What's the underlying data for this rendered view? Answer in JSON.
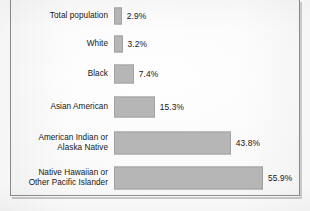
{
  "chart_data": {
    "type": "bar",
    "orientation": "horizontal",
    "title": "",
    "subtitle": "",
    "xlabel": "",
    "ylabel": "",
    "grid": false,
    "legend": null,
    "axis_visible": false,
    "value_suffix": "%",
    "xlim": [
      0,
      55.9
    ],
    "categories": [
      "Total population",
      "White",
      "Black",
      "Asian American",
      "American Indian or\nAlaska Native",
      "Native Hawaiian or\nOther Pacific Islander"
    ],
    "values": [
      2.9,
      3.2,
      7.4,
      15.3,
      43.8,
      55.9
    ],
    "value_labels": [
      "2.9%",
      "3.2%",
      "7.4%",
      "15.3%",
      "43.8%",
      "55.9%"
    ],
    "bar_color": "#b6b6b6",
    "bar_border_color": "#a2a2a2",
    "text_color": "#161616",
    "frame_border_color": "#8d8d8d",
    "background_color": "#fcfcfc"
  },
  "layout": {
    "bar_origin_x": 113,
    "px_per_percent": 2.665,
    "rows": [
      {
        "top": 6,
        "height": 22,
        "bar_height": 17
      },
      {
        "top": 33,
        "height": 24,
        "bar_height": 17
      },
      {
        "top": 62,
        "height": 26,
        "bar_height": 19
      },
      {
        "top": 94,
        "height": 28,
        "bar_height": 21
      },
      {
        "top": 128,
        "height": 32,
        "bar_height": 23
      },
      {
        "top": 163,
        "height": 32,
        "bar_height": 23
      }
    ]
  }
}
